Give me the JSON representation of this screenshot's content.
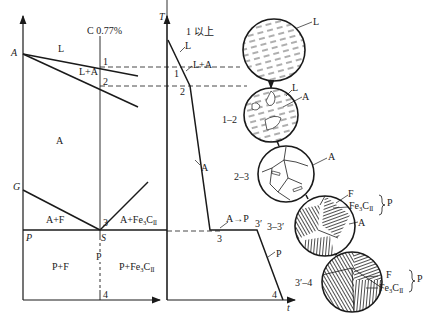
{
  "diagram": {
    "type": "Fe-C phase diagram section with cooling curve and microstructure evolution (eutectoid steel)",
    "left_panel": {
      "composition_label": "C 0.77%",
      "points": {
        "A": "A",
        "G": "G",
        "P": "P",
        "S": "S"
      },
      "regions": {
        "liquid": "L",
        "liquid_austenite": "L+A",
        "austenite": "A",
        "austenite_ferrite": "A+F",
        "austenite_cementite": "A+Fe3CII",
        "pearlite_ferrite": "P+F",
        "pearlite": "P",
        "pearlite_cementite": "P+Fe3CII"
      },
      "marks": [
        "1",
        "2",
        "3",
        "4"
      ]
    },
    "cooling_curve": {
      "y_axis": "T",
      "x_axis": "t",
      "marks": [
        "1",
        "2",
        "3",
        "3′",
        "4"
      ],
      "labels": {
        "liquid": "L",
        "liquid_austenite": "L+A",
        "austenite": "A",
        "transformation": "A→P",
        "pearlite": "P"
      }
    },
    "microstructures": [
      {
        "stage": "1 以上",
        "labels": [
          "L"
        ]
      },
      {
        "stage": "1–2",
        "labels": [
          "L",
          "A"
        ]
      },
      {
        "stage": "2–3",
        "labels": [
          "A"
        ]
      },
      {
        "stage": "3–3′",
        "labels": [
          "F",
          "Fe3CII",
          "A"
        ],
        "group": "P"
      },
      {
        "stage": "3′–4",
        "labels": [
          "F",
          "Fe3CII"
        ],
        "group": "P"
      }
    ]
  }
}
